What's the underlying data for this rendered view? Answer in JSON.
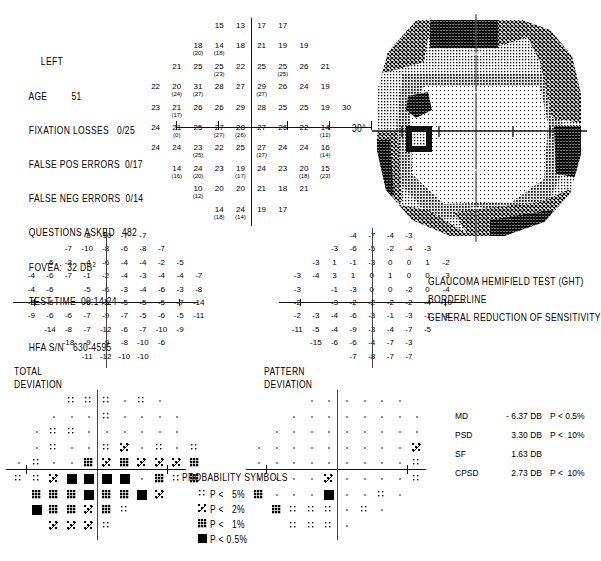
{
  "header": {
    "eye": "LEFT",
    "age_label": "AGE",
    "age_value": "51",
    "fixation_losses_label": "FIXATION LOSSES",
    "fixation_losses_value": "0/25",
    "false_pos_label": "FALSE POS ERRORS",
    "false_pos_value": "0/17",
    "false_neg_label": "FALSE NEG ERRORS",
    "false_neg_value": "0/14",
    "questions_label": "QUESTIONS ASKED",
    "questions_value": "482",
    "fovea_label": "FOVEA:",
    "fovea_value": "32 DB",
    "fovea_sup": "2",
    "test_time_label": "TEST TIME",
    "test_time_value": "00:14:24",
    "serial_label": "HFA S/N",
    "serial_value": "630-4595"
  },
  "grayscale": {
    "degree_label": "30°"
  },
  "ght": {
    "title": "GLAUCOMA HEMIFIELD TEST (GHT)",
    "line1": "BORDERLINE",
    "line2": "GENERAL REDUCTION OF SENSITIVITY"
  },
  "indices": [
    {
      "name": "MD",
      "value": "- 6.37 DB",
      "p": "P < 0.5%"
    },
    {
      "name": "PSD",
      "value": "3.30 DB",
      "p": "P <  10%"
    },
    {
      "name": "SF",
      "value": "1.63 DB",
      "p": ""
    },
    {
      "name": "CPSD",
      "value": "2.73 DB",
      "p": "P <  10%"
    }
  ],
  "total_deviation_label": {
    "l1": "TOTAL",
    "l2": "DEVIATION"
  },
  "pattern_deviation_label": {
    "l1": "PATTERN",
    "l2": "DEVIATION"
  },
  "probability_symbols": {
    "title": "PROBABILITY SYMBOLS",
    "items": [
      {
        "symbol": "p5",
        "label": "P <   5%"
      },
      {
        "symbol": "p2",
        "label": "P <   2%"
      },
      {
        "symbol": "p1",
        "label": "P <   1%"
      },
      {
        "symbol": "p05",
        "label": "P < 0.5%"
      }
    ]
  },
  "chart_data": {
    "type": "table",
    "threshold_grid": {
      "note": "dB threshold values; values in parentheses are retest values",
      "rows": [
        [
          null,
          null,
          null,
          {
            "v": "15"
          },
          {
            "v": "13"
          },
          {
            "v": "17"
          },
          {
            "v": "17"
          },
          null,
          null,
          null
        ],
        [
          null,
          null,
          {
            "v": "18",
            "r": "20"
          },
          {
            "v": "14",
            "r": "18"
          },
          {
            "v": "18"
          },
          {
            "v": "21"
          },
          {
            "v": "19"
          },
          {
            "v": "19"
          },
          null,
          null
        ],
        [
          null,
          {
            "v": "21"
          },
          {
            "v": "25"
          },
          {
            "v": "25",
            "r": "23"
          },
          {
            "v": "22"
          },
          {
            "v": "25"
          },
          {
            "v": "25",
            "r": "25"
          },
          {
            "v": "26"
          },
          {
            "v": "21"
          },
          null
        ],
        [
          {
            "v": "22"
          },
          {
            "v": "20",
            "r": "24"
          },
          {
            "v": "31",
            "r": "27"
          },
          {
            "v": "28"
          },
          {
            "v": "27"
          },
          {
            "v": "29",
            "r": "27"
          },
          {
            "v": "26"
          },
          {
            "v": "24"
          },
          {
            "v": "19"
          },
          null
        ],
        [
          {
            "v": "23"
          },
          {
            "v": "21",
            "r": "17"
          },
          {
            "v": "26"
          },
          {
            "v": "26"
          },
          {
            "v": "29"
          },
          {
            "v": "28"
          },
          {
            "v": "25"
          },
          {
            "v": "25"
          },
          {
            "v": "19"
          },
          {
            "v": "30"
          }
        ],
        [
          {
            "v": "24"
          },
          {
            "v": "21",
            "r": "0"
          },
          {
            "v": "25"
          },
          {
            "v": "27",
            "r": "27"
          },
          {
            "v": "28",
            "r": "26"
          },
          {
            "v": "27"
          },
          {
            "v": "26"
          },
          {
            "v": "22"
          },
          {
            "v": "14",
            "r": "12"
          },
          null
        ],
        [
          {
            "v": "24"
          },
          {
            "v": "24"
          },
          {
            "v": "23",
            "r": "25"
          },
          {
            "v": "22"
          },
          {
            "v": "25"
          },
          {
            "v": "27",
            "r": "27"
          },
          {
            "v": "24"
          },
          {
            "v": "24"
          },
          {
            "v": "16",
            "r": "14"
          },
          null
        ],
        [
          null,
          {
            "v": "14",
            "r": "16"
          },
          {
            "v": "24",
            "r": "20"
          },
          {
            "v": "23"
          },
          {
            "v": "19",
            "r": "17"
          },
          {
            "v": "24"
          },
          {
            "v": "23"
          },
          {
            "v": "20",
            "r": "18"
          },
          {
            "v": "15",
            "r": "23"
          },
          null
        ],
        [
          null,
          null,
          {
            "v": "10",
            "r": "12"
          },
          {
            "v": "20"
          },
          {
            "v": "20"
          },
          {
            "v": "21"
          },
          {
            "v": "18"
          },
          {
            "v": "21"
          },
          null,
          null
        ],
        [
          null,
          null,
          null,
          {
            "v": "14",
            "r": "18"
          },
          {
            "v": "24",
            "r": "14"
          },
          {
            "v": "19"
          },
          {
            "v": "17"
          },
          null,
          null,
          null
        ]
      ]
    },
    "total_deviation": {
      "rows": [
        [
          null,
          null,
          null,
          "-8",
          "-10",
          "-7",
          "-7",
          null,
          null,
          null
        ],
        [
          null,
          null,
          "-7",
          "-10",
          "-8",
          "-6",
          "-8",
          "-7",
          null,
          null
        ],
        [
          null,
          "-6",
          "-3",
          "-4",
          "-6",
          "-4",
          "-4",
          "-2",
          "-5",
          null
        ],
        [
          "-4",
          "-6",
          "-7",
          "-1",
          "-2",
          "-4",
          "-3",
          "-4",
          "-4",
          "-7"
        ],
        [
          "-4",
          "-6",
          "",
          "-5",
          "-6",
          "-3",
          "-4",
          "-6",
          "-3",
          "-8"
        ],
        [
          "-5",
          "-6",
          "",
          "-6",
          "-5",
          "-5",
          "-5",
          "-5",
          "-7",
          "-14"
        ],
        [
          "-9",
          "-6",
          "-6",
          "-7",
          "-9",
          "-7",
          "-5",
          "-6",
          "-5",
          "-11"
        ],
        [
          null,
          "-14",
          "-8",
          "-7",
          "-12",
          "-6",
          "-7",
          "-10",
          "-9",
          null
        ],
        [
          null,
          null,
          "-18",
          "-9",
          "-9",
          "-8",
          "-10",
          "-6",
          null,
          null
        ],
        [
          null,
          null,
          null,
          "-11",
          "-12",
          "-10",
          "-10",
          null,
          null,
          null
        ]
      ]
    },
    "pattern_deviation": {
      "rows": [
        [
          null,
          null,
          null,
          "-4",
          "-7",
          "-4",
          "-3",
          null,
          null,
          null
        ],
        [
          null,
          null,
          "-3",
          "-6",
          "-5",
          "-2",
          "-4",
          "-3",
          null,
          null
        ],
        [
          null,
          "-3",
          "1",
          "-1",
          "-3",
          "0",
          "0",
          "1",
          "-2",
          null
        ],
        [
          "-3",
          "-4",
          "3",
          "1",
          "0",
          "1",
          "0",
          "0",
          "-3",
          null
        ],
        [
          "-3",
          "",
          "-1",
          "-3",
          "0",
          "0",
          "-2",
          "0",
          "-4",
          null
        ],
        [
          "-2",
          "",
          "-3",
          "-2",
          "-2",
          "-2",
          "-2",
          "-4",
          "-10",
          null
        ],
        [
          "-2",
          "-3",
          "-4",
          "-6",
          "-3",
          "-1",
          "-3",
          "-1",
          "-8",
          null
        ],
        [
          "-11",
          "-5",
          "-4",
          "-9",
          "-3",
          "-4",
          "-7",
          "-5",
          null,
          null
        ],
        [
          null,
          "-15",
          "-6",
          "-6",
          "-4",
          "-7",
          "-3",
          null,
          null,
          null
        ],
        [
          null,
          null,
          null,
          "-7",
          "-8",
          "-7",
          "-7",
          null,
          null,
          null
        ]
      ]
    },
    "total_deviation_symbols": {
      "legend": [
        "blank",
        "p5",
        "p2",
        "p1",
        "p05"
      ],
      "rows": [
        [
          null,
          null,
          null,
          "p5",
          "p5",
          "p5",
          "blank",
          "p5",
          "blank",
          null
        ],
        [
          null,
          null,
          "blank",
          "blank",
          "blank",
          "p5",
          "blank",
          "blank",
          "blank",
          "blank"
        ],
        [
          null,
          "blank",
          "p5",
          "p5",
          "blank",
          "blank",
          "blank",
          "blank",
          "blank",
          "blank"
        ],
        [
          null,
          "blank",
          "p5",
          "blank",
          "blank",
          "p5",
          "p2",
          "blank",
          "p5",
          "blank",
          "p5"
        ],
        [
          "blank",
          "p5",
          "blank",
          "blank",
          "p1",
          "p2",
          "p1",
          "p2",
          "p2",
          "p2",
          "p1"
        ],
        [
          "p5",
          "p5",
          "p2",
          "p05",
          "p05",
          "p05",
          "p05",
          "blank",
          "p1",
          "p5",
          "p1"
        ],
        [
          null,
          "p1",
          "p1",
          "p1",
          "p05",
          "p1",
          "p1",
          "p05",
          "p2",
          null,
          null
        ],
        [
          null,
          "p05",
          "p1",
          "p1",
          "p2",
          "p1",
          "p5",
          null,
          null,
          null
        ],
        [
          null,
          null,
          "p2",
          "p2",
          "p2",
          "p5",
          null,
          null,
          null,
          null
        ]
      ]
    },
    "pattern_deviation_symbols": {
      "rows": [
        [
          null,
          null,
          null,
          "blank",
          "blank",
          "blank",
          "blank",
          "blank",
          "blank",
          null
        ],
        [
          null,
          null,
          "blank",
          "blank",
          "blank",
          "blank",
          "blank",
          "blank",
          "blank",
          "blank"
        ],
        [
          null,
          "blank",
          "blank",
          "blank",
          "blank",
          "blank",
          "blank",
          "blank",
          "blank",
          "blank"
        ],
        [
          "blank",
          "blank",
          "blank",
          "blank",
          "blank",
          "blank",
          "blank",
          "blank",
          "blank",
          "p2"
        ],
        [
          "blank",
          "blank",
          "blank",
          "blank",
          "blank",
          "blank",
          "blank",
          "blank",
          "blank",
          "p5"
        ],
        [
          "blank",
          "blank",
          "blank",
          "blank",
          "p2",
          "blank",
          "blank",
          "blank",
          "blank",
          "p5"
        ],
        [
          "p1",
          "blank",
          "blank",
          "blank",
          "p05",
          "blank",
          "blank",
          "p5",
          "blank",
          null
        ],
        [
          null,
          "p1",
          "p5",
          "p5",
          "p5",
          "blank",
          "p5",
          "blank",
          null,
          null
        ],
        [
          null,
          null,
          "p5",
          "p5",
          "p5",
          "blank",
          null,
          null,
          null,
          null
        ]
      ]
    }
  }
}
